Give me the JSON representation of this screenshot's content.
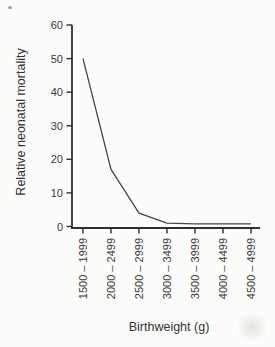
{
  "figure": {
    "background": "#fcfcfb",
    "axis_color": "#2f2f2f",
    "line_color": "#454545",
    "text_color": "#3a3a3a"
  },
  "chart_data": {
    "type": "line",
    "title": "",
    "xlabel": "Birthweight (g)",
    "ylabel": "Relative neonatal mortality",
    "categories": [
      "1500 – 1999",
      "2000 – 2499",
      "2500 – 2999",
      "3000 – 3499",
      "3500 – 3999",
      "4000 – 4499",
      "4500 – 4999"
    ],
    "series": [
      {
        "name": "relative-neonatal-mortality",
        "values": [
          50,
          17,
          4,
          1,
          0.8,
          0.8,
          0.8
        ]
      }
    ],
    "ylim": [
      0,
      60
    ],
    "yticks": [
      0,
      10,
      20,
      30,
      40,
      50,
      60
    ],
    "grid": false,
    "legend": "none"
  }
}
